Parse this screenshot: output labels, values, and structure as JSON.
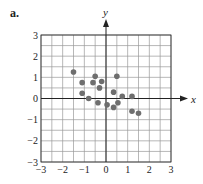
{
  "figure_label": "a.",
  "chart_data": {
    "type": "scatter",
    "title": "",
    "xlabel": "x",
    "ylabel": "y",
    "xlim": [
      -3,
      3
    ],
    "ylim": [
      -3,
      3
    ],
    "grid": true,
    "grid_step": 0.5,
    "xticks": [
      -3,
      -2,
      -1,
      0,
      1,
      2,
      3
    ],
    "yticks": [
      -3,
      -2,
      -1,
      0,
      1,
      2,
      3
    ],
    "points": [
      {
        "x": -1.5,
        "y": 1.25
      },
      {
        "x": -1.1,
        "y": 0.75
      },
      {
        "x": -1.1,
        "y": 0.25
      },
      {
        "x": -0.8,
        "y": 0.0
      },
      {
        "x": -0.6,
        "y": 0.75
      },
      {
        "x": -0.5,
        "y": 1.05
      },
      {
        "x": -0.37,
        "y": -0.2
      },
      {
        "x": -0.3,
        "y": 0.5
      },
      {
        "x": -0.2,
        "y": 0.8
      },
      {
        "x": 0.05,
        "y": -0.3
      },
      {
        "x": 0.35,
        "y": 0.3
      },
      {
        "x": 0.35,
        "y": -0.42
      },
      {
        "x": 0.5,
        "y": 1.05
      },
      {
        "x": 0.55,
        "y": -0.2
      },
      {
        "x": 0.75,
        "y": 0.1
      },
      {
        "x": 1.2,
        "y": 0.1
      },
      {
        "x": 1.2,
        "y": -0.6
      },
      {
        "x": 1.5,
        "y": -0.7
      }
    ],
    "point_color": "#6e6e6e",
    "grid_color": "#9a9a9a",
    "axis_color": "#222222"
  }
}
